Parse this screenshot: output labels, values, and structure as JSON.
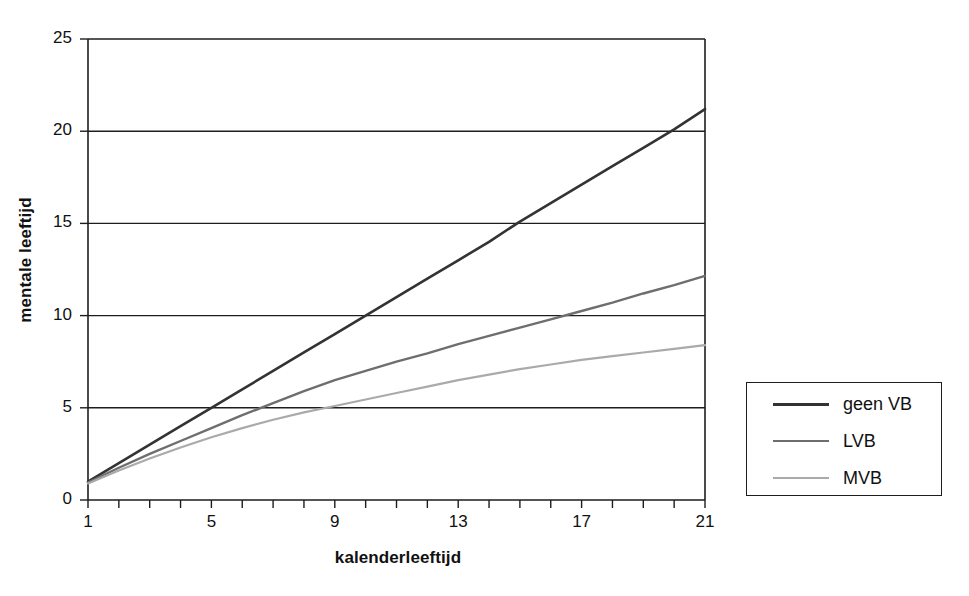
{
  "chart_data": {
    "type": "line",
    "title": "",
    "xlabel": "kalenderleeftijd",
    "ylabel": "mentale leeftijd",
    "xlim": [
      1,
      21
    ],
    "ylim": [
      0,
      25
    ],
    "grid": "horizontal",
    "legend_position": "right",
    "x": [
      1,
      2,
      3,
      4,
      5,
      6,
      7,
      8,
      9,
      10,
      11,
      12,
      13,
      14,
      15,
      16,
      17,
      18,
      19,
      20,
      21
    ],
    "xticks_all": [
      1,
      2,
      3,
      4,
      5,
      6,
      7,
      8,
      9,
      10,
      11,
      12,
      13,
      14,
      15,
      16,
      17,
      18,
      19,
      20,
      21
    ],
    "xtick_labels": [
      "1",
      "5",
      "9",
      "13",
      "17",
      "21"
    ],
    "xtick_label_values": [
      1,
      5,
      9,
      13,
      17,
      21
    ],
    "ytick_labels": [
      "0",
      "5",
      "10",
      "15",
      "20",
      "25"
    ],
    "ytick_values": [
      0,
      5,
      10,
      15,
      20,
      25
    ],
    "series": [
      {
        "name": "geen VB",
        "color": "#333333",
        "width": 2.6,
        "values": [
          1.0,
          2.0,
          3.0,
          4.0,
          5.0,
          6.0,
          7.0,
          8.0,
          9.0,
          10.0,
          11.0,
          12.0,
          13.0,
          14.0,
          15.1,
          16.1,
          17.1,
          18.1,
          19.1,
          20.1,
          21.2
        ]
      },
      {
        "name": "LVB",
        "color": "#6e6e6e",
        "width": 2.4,
        "values": [
          0.95,
          1.75,
          2.5,
          3.2,
          3.9,
          4.6,
          5.25,
          5.9,
          6.5,
          7.0,
          7.5,
          7.95,
          8.45,
          8.9,
          9.35,
          9.8,
          10.25,
          10.7,
          11.2,
          11.65,
          12.15
        ]
      },
      {
        "name": "MVB",
        "color": "#aaaaaa",
        "width": 2.2,
        "values": [
          0.9,
          1.6,
          2.25,
          2.85,
          3.4,
          3.9,
          4.35,
          4.75,
          5.1,
          5.45,
          5.8,
          6.15,
          6.5,
          6.8,
          7.1,
          7.35,
          7.6,
          7.8,
          8.0,
          8.2,
          8.4
        ]
      }
    ]
  },
  "legend": {
    "entries": [
      {
        "label": "geen VB",
        "color": "#333333",
        "width": 3
      },
      {
        "label": "LVB",
        "color": "#6e6e6e",
        "width": 2.6
      },
      {
        "label": "MVB",
        "color": "#aaaaaa",
        "width": 2.2
      }
    ]
  },
  "axes": {
    "x_title": "kalenderleeftijd",
    "y_title": "mentale leeftijd"
  },
  "colors": {
    "axis": "#1d1d1d",
    "grid": "#1d1d1d",
    "background": "#ffffff",
    "text": "#111111"
  }
}
